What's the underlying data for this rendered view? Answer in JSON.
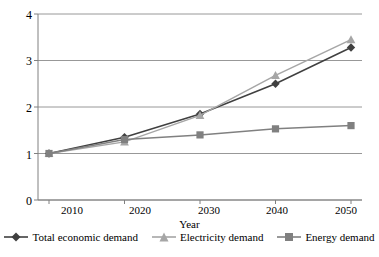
{
  "chart_data": {
    "type": "line",
    "title": "",
    "xlabel": "Year",
    "ylabel": "",
    "x": [
      2010,
      2020,
      2030,
      2040,
      2050
    ],
    "categories": [
      "2010",
      "2020",
      "2030",
      "2040",
      "2050"
    ],
    "series": [
      {
        "name": "Total economic demand",
        "marker": "diamond",
        "color": "#404040",
        "values": [
          1.0,
          1.35,
          1.85,
          2.5,
          3.28
        ]
      },
      {
        "name": "Electricity demand",
        "marker": "triangle",
        "color": "#a6a6a6",
        "values": [
          1.0,
          1.25,
          1.82,
          2.68,
          3.45
        ]
      },
      {
        "name": "Energy demand",
        "marker": "square",
        "color": "#808080",
        "values": [
          1.0,
          1.3,
          1.4,
          1.53,
          1.6
        ]
      }
    ],
    "ylim": [
      0,
      4
    ],
    "yticks": [
      0,
      1,
      2,
      3,
      4
    ],
    "ytick_labels": [
      "0",
      "1",
      "2",
      "3",
      "4"
    ],
    "xlim": [
      2005,
      2055
    ],
    "grid": true,
    "grid_axis": "y",
    "legend_position": "bottom"
  },
  "axes": {
    "x_title": "Year",
    "y_tick_labels": [
      "4",
      "3",
      "2",
      "1",
      "0"
    ],
    "x_tick_labels": [
      "2010",
      "2020",
      "2030",
      "2040",
      "2050"
    ]
  },
  "legend": {
    "items": [
      {
        "label": "Total economic demand",
        "marker": "diamond-marker-icon",
        "color": "#404040"
      },
      {
        "label": "Electricity demand",
        "marker": "triangle-marker-icon",
        "color": "#a6a6a6"
      },
      {
        "label": "Energy demand",
        "marker": "square-marker-icon",
        "color": "#808080"
      }
    ]
  },
  "style": {
    "grid_color": "#8c8c8c",
    "axis_color": "#808080",
    "background": "#ffffff"
  }
}
